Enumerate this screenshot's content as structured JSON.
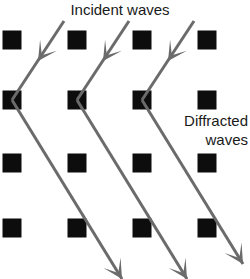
{
  "diagram": {
    "background_color": "#ffffff",
    "atom_color": "#0d0d0d",
    "ray_color": "#6b6b6b",
    "text_color": "#1a1a1a"
  },
  "labels": {
    "incident": "Incident waves",
    "diffracted_line1": "Diffracted",
    "diffracted_line2": "waves"
  },
  "lattice": {
    "rows": 4,
    "columns": 4,
    "atom_size": 19,
    "column_centers": [
      12,
      77,
      142,
      207
    ],
    "row_centers": [
      40,
      100,
      163,
      228
    ]
  },
  "incident_waves": {
    "count": 3,
    "direction": "down-left",
    "arrowhead_position": "midpoint",
    "rays": [
      {
        "x1": 64,
        "y1": 21,
        "x2": 12,
        "y2": 100,
        "arrow_x": 38,
        "arrow_y": 61
      },
      {
        "x1": 129,
        "y1": 21,
        "x2": 77,
        "y2": 100,
        "arrow_x": 103,
        "arrow_y": 61
      },
      {
        "x1": 194,
        "y1": 21,
        "x2": 142,
        "y2": 100,
        "arrow_x": 168,
        "arrow_y": 61
      }
    ]
  },
  "diffracted_waves": {
    "count": 3,
    "direction": "down-right",
    "arrowhead_position": "endpoint",
    "rays": [
      {
        "x1": 12,
        "y1": 100,
        "x2": 122,
        "y2": 279
      },
      {
        "x1": 77,
        "y1": 100,
        "x2": 187,
        "y2": 279
      },
      {
        "x1": 142,
        "y1": 100,
        "x2": 243,
        "y2": 264
      }
    ]
  }
}
